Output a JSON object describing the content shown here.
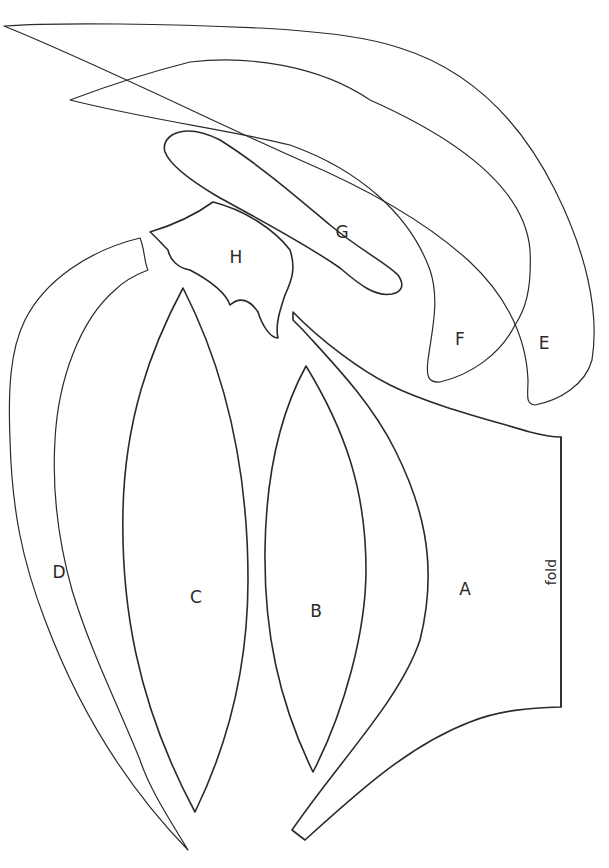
{
  "pattern": {
    "background": "#ffffff",
    "line_color": "#2a2a2a",
    "pieces": [
      {
        "id": "A",
        "label": "A",
        "x": 465,
        "y": 590
      },
      {
        "id": "B",
        "label": "B",
        "x": 316,
        "y": 612
      },
      {
        "id": "C",
        "label": "C",
        "x": 196,
        "y": 598
      },
      {
        "id": "D",
        "label": "D",
        "x": 59,
        "y": 573
      },
      {
        "id": "E",
        "label": "E",
        "x": 544,
        "y": 344
      },
      {
        "id": "F",
        "label": "F",
        "x": 460,
        "y": 340
      },
      {
        "id": "G",
        "label": "G",
        "x": 342,
        "y": 233
      },
      {
        "id": "H",
        "label": "H",
        "x": 236,
        "y": 258
      }
    ],
    "fold": {
      "label": "fold",
      "x": 552,
      "y": 572,
      "rotation": -90
    }
  }
}
